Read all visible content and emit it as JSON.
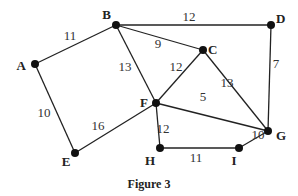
{
  "figure": {
    "caption": "Figure 3",
    "nodes": [
      {
        "id": "A",
        "x": 35,
        "y": 64,
        "lx": 26,
        "ly": 70,
        "anchor": "end"
      },
      {
        "id": "B",
        "x": 116,
        "y": 25,
        "lx": 111,
        "ly": 19,
        "anchor": "end"
      },
      {
        "id": "C",
        "x": 203,
        "y": 50,
        "lx": 208,
        "ly": 54,
        "anchor": "start"
      },
      {
        "id": "D",
        "x": 271,
        "y": 25,
        "lx": 276,
        "ly": 23,
        "anchor": "start"
      },
      {
        "id": "E",
        "x": 75,
        "y": 153,
        "lx": 66,
        "ly": 166,
        "anchor": "middle"
      },
      {
        "id": "F",
        "x": 156,
        "y": 103,
        "lx": 148,
        "ly": 107,
        "anchor": "end"
      },
      {
        "id": "G",
        "x": 268,
        "y": 131,
        "lx": 276,
        "ly": 140,
        "anchor": "start"
      },
      {
        "id": "H",
        "x": 160,
        "y": 148,
        "lx": 150,
        "ly": 165,
        "anchor": "middle"
      },
      {
        "id": "I",
        "x": 239,
        "y": 148,
        "lx": 234,
        "ly": 165,
        "anchor": "middle"
      }
    ],
    "edges": [
      {
        "from": "A",
        "to": "B",
        "weight": "11",
        "wx": 70,
        "wy": 40
      },
      {
        "from": "A",
        "to": "E",
        "weight": "10",
        "wx": 44,
        "wy": 117
      },
      {
        "from": "B",
        "to": "D",
        "weight": "12",
        "wx": 189,
        "wy": 21
      },
      {
        "from": "B",
        "to": "C",
        "weight": "9",
        "wx": 158,
        "wy": 48
      },
      {
        "from": "B",
        "to": "F",
        "weight": "13",
        "wx": 125,
        "wy": 71
      },
      {
        "from": "C",
        "to": "F",
        "weight": "12",
        "wx": 176,
        "wy": 71
      },
      {
        "from": "C",
        "to": "G",
        "weight": "13",
        "wx": 227,
        "wy": 87
      },
      {
        "from": "D",
        "to": "G",
        "weight": "7",
        "wx": 276,
        "wy": 68
      },
      {
        "from": "F",
        "to": "G",
        "weight": "5",
        "wx": 203,
        "wy": 101
      },
      {
        "from": "E",
        "to": "F",
        "weight": "16",
        "wx": 98,
        "wy": 130
      },
      {
        "from": "F",
        "to": "H",
        "weight": "12",
        "wx": 163,
        "wy": 133
      },
      {
        "from": "H",
        "to": "I",
        "weight": "11",
        "wx": 196,
        "wy": 162
      },
      {
        "from": "I",
        "to": "G",
        "weight": "10",
        "wx": 258,
        "wy": 139
      }
    ]
  }
}
